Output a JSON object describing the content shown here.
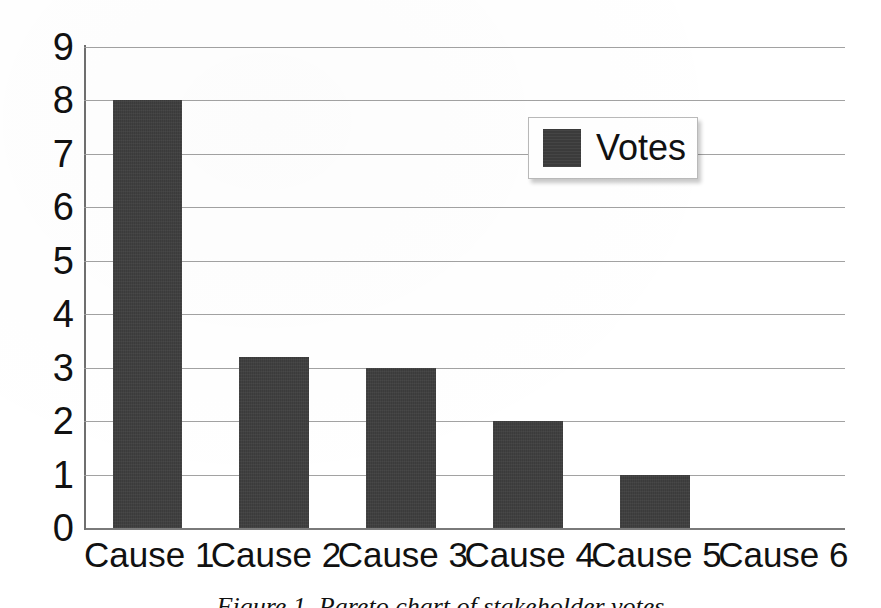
{
  "chart_data": {
    "type": "bar",
    "title": "",
    "xlabel": "",
    "ylabel": "",
    "categories": [
      "Cause 1",
      "Cause 2",
      "Cause 3",
      "Cause 4",
      "Cause 5",
      "Cause 6"
    ],
    "values": [
      8,
      3.2,
      3,
      2,
      1,
      0
    ],
    "series": [
      {
        "name": "Votes",
        "values": [
          8,
          3.2,
          3,
          2,
          1,
          0
        ]
      }
    ],
    "ylim": [
      0,
      9
    ],
    "ytick_labels": [
      "9",
      "8",
      "7",
      "6",
      "5",
      "4",
      "3",
      "2",
      "1",
      "0"
    ],
    "ytick_values": [
      9,
      8,
      7,
      6,
      5,
      4,
      3,
      2,
      1,
      0
    ],
    "grid": true,
    "grid_axis": "y",
    "legend": {
      "position": "upper-right-inside",
      "entries": [
        "Votes"
      ]
    },
    "bar_color": "#3b3b3b",
    "gridline_color": "#9a9a9a",
    "axis_color": "#6f6f6f",
    "background_color": "#ffffff"
  },
  "legend": {
    "label": "Votes"
  },
  "caption": {
    "text": "Figure 1. Pareto chart of stakeholder votes"
  }
}
